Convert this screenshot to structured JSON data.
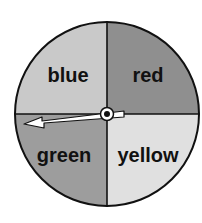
{
  "spinner": {
    "sections": [
      {
        "label": "blue",
        "color": "#c9c9c9"
      },
      {
        "label": "red",
        "color": "#8f8f8f"
      },
      {
        "label": "green",
        "color": "#9d9d9d"
      },
      {
        "label": "yellow",
        "color": "#e0e0e0"
      }
    ],
    "pointer": {
      "direction": "left",
      "points_to": "green"
    }
  }
}
